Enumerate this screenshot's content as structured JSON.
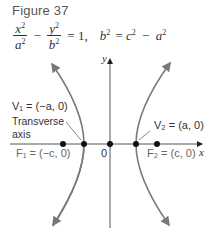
{
  "figure": {
    "title": "Figure 37",
    "equation": {
      "term1_num": "x",
      "term1_den": "a",
      "minus": "−",
      "term2_num": "y",
      "term2_den": "b",
      "equals_one": "= 1,",
      "relation_lhs": "b",
      "relation_rhs": "= c",
      "relation_minus": "−",
      "relation_a": "a",
      "exp": "2"
    }
  },
  "diagram": {
    "axes": {
      "x_label": "x",
      "y_label": "y",
      "origin_label": "0"
    },
    "points": {
      "V1": "V₁ = (−a, 0)",
      "V2": "V₂ = (a, 0)",
      "F1": "F₁ = (−c, 0)",
      "F2": "F₂ = (c, 0)"
    },
    "transverse_axis_label_1": "Transverse",
    "transverse_axis_label_2": "axis",
    "colors": {
      "curve": "#7a7a7a",
      "axis": "#555555",
      "point": "#111111"
    }
  }
}
